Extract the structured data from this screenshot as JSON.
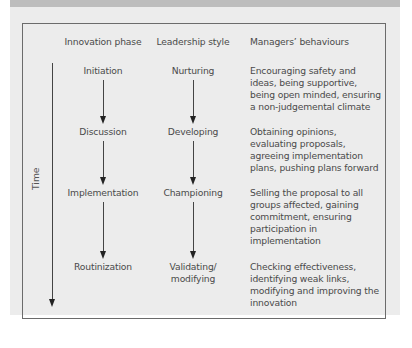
{
  "diagram": {
    "headers": {
      "phase": "Innovation phase",
      "style": "Leadership style",
      "behaviours": "Managers’ behaviours"
    },
    "axis_label": "Time",
    "rows": [
      {
        "phase": "Initiation",
        "style": "Nurturing",
        "behaviours": "Encouraging safety and ideas, being supportive, being open minded, ensuring a non-judgemental climate"
      },
      {
        "phase": "Discussion",
        "style": "Developing",
        "behaviours": "Obtaining opinions, evaluating proposals, agreeing implementation plans, pushing plans forward"
      },
      {
        "phase": "Implementation",
        "style": "Championing",
        "behaviours": "Selling the proposal to all groups affected, gaining commitment, ensuring participation in implementation"
      },
      {
        "phase": "Routinization",
        "style": "Validating/ modifying",
        "behaviours": "Checking effectiveness, identifying weak links, modifying and improving the innovation"
      }
    ],
    "colors": {
      "background_panel": "#ececec",
      "banner": "#bdbdbd",
      "frame": "#6b6b6b",
      "text": "#4a4a4a",
      "arrows": "#222222"
    }
  }
}
